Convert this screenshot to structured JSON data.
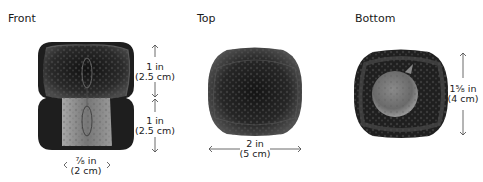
{
  "views": {
    "front": {
      "title": "Front",
      "dims": {
        "upper": {
          "in": "1 in",
          "cm": "(2.5 cm)"
        },
        "lower": {
          "in": "1 in",
          "cm": "(2.5 cm)"
        },
        "width": {
          "in": "⅞ in",
          "cm": "(2 cm)"
        }
      }
    },
    "top": {
      "title": "Top",
      "dims": {
        "width": {
          "in": "2 in",
          "cm": "(5 cm)"
        }
      }
    },
    "bottom": {
      "title": "Bottom",
      "dims": {
        "height": {
          "in": "1⅝ in",
          "cm": "(4 cm)"
        }
      }
    }
  },
  "colors": {
    "pompom_dark": "#1c1c1c",
    "fur_mid": "#5a5a5a",
    "stem_light": "#9a9a9a"
  }
}
